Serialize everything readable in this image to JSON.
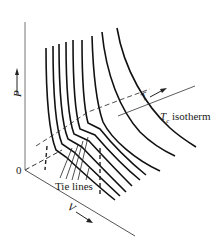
{
  "diagram": {
    "type": "P-V-T surface of a substance showing isotherms near the critical point",
    "axes": {
      "p_label": "P",
      "v_label": "V",
      "t_label": "T",
      "origin_label": "0"
    },
    "annotations": {
      "tc_symbol": "T",
      "tc_subscript": "c",
      "tc_rest": " isotherm",
      "tie_lines": "Tie lines"
    },
    "colors": {
      "line": "#111111",
      "axis": "#555555",
      "text": "#1a1a1a"
    }
  }
}
